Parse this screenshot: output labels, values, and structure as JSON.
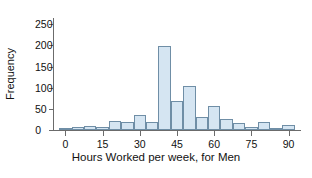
{
  "chart_data": {
    "type": "bar",
    "title": "",
    "xlabel": "Hours Worked per week, for Men",
    "ylabel": "Frequency",
    "xlim": [
      -5,
      95
    ],
    "ylim": [
      0,
      265
    ],
    "grid": false,
    "legend": "none",
    "bin_width": 5,
    "xticks": [
      0,
      15,
      30,
      45,
      60,
      75,
      90
    ],
    "xtick_labels": [
      "0",
      "15",
      "30",
      "45",
      "60",
      "75",
      "90"
    ],
    "yticks": [
      0,
      50,
      100,
      150,
      200,
      250
    ],
    "ytick_labels": [
      "0",
      "50",
      "100",
      "150",
      "200",
      "250"
    ],
    "bin_edges": [
      -2.5,
      2.5,
      7.5,
      12.5,
      17.5,
      22.5,
      27.5,
      32.5,
      37.5,
      42.5,
      47.5,
      52.5,
      57.5,
      62.5,
      67.5,
      72.5,
      77.5,
      82.5,
      87.5,
      92.5
    ],
    "categories": [
      "-2.5-2.5",
      "2.5-7.5",
      "7.5-12.5",
      "12.5-17.5",
      "17.5-22.5",
      "22.5-27.5",
      "27.5-32.5",
      "32.5-37.5",
      "37.5-42.5",
      "42.5-47.5",
      "47.5-52.5",
      "52.5-57.5",
      "57.5-62.5",
      "62.5-67.5",
      "67.5-72.5",
      "72.5-77.5",
      "77.5-82.5",
      "82.5-87.5",
      "87.5-92.5"
    ],
    "values": [
      4,
      7,
      10,
      8,
      21,
      19,
      36,
      19,
      199,
      68,
      103,
      31,
      56,
      25,
      16,
      7,
      18,
      4,
      11
    ],
    "bar_fill_color": "#d5e5f2",
    "bar_edge_color": "#6f8ea6",
    "axis_color": "#6b6b6b",
    "text_color": "#121212"
  }
}
